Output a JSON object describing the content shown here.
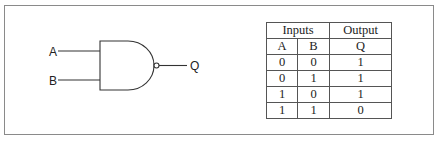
{
  "diagram": {
    "gate": {
      "type": "NAND",
      "inputs": [
        "A",
        "B"
      ],
      "output": "Q"
    },
    "truth_table": {
      "group_headers": {
        "inputs": "Inputs",
        "output": "Output"
      },
      "columns": [
        "A",
        "B",
        "Q"
      ],
      "rows": [
        [
          "0",
          "0",
          "1"
        ],
        [
          "0",
          "1",
          "1"
        ],
        [
          "1",
          "0",
          "1"
        ],
        [
          "1",
          "1",
          "0"
        ]
      ]
    },
    "colors": {
      "line": "#333333",
      "frame": "#8a8a8a",
      "background": "#ffffff"
    }
  }
}
